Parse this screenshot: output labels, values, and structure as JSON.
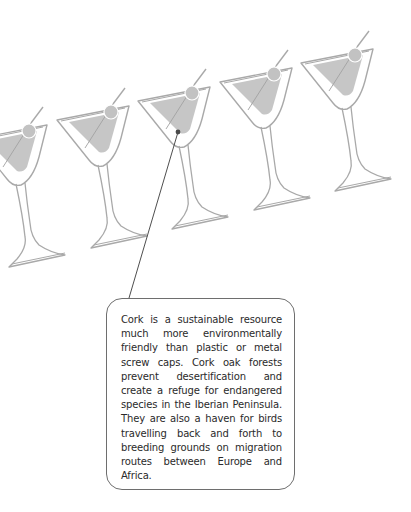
{
  "illustration": {
    "subject": "row of martini glasses",
    "glass_count": 5,
    "colors": {
      "outline": "#a9a9a9",
      "liquid": "#c6c6c6",
      "olive": "#c2c2c2",
      "pointer_line": "#3a3a3a",
      "pointer_dot": "#4a4a4a",
      "box_border": "#6e6e6e",
      "text": "#2a2a2a"
    }
  },
  "callout": {
    "text": "Cork is a sustainable resource much more environmentally friendly than plastic or metal screw caps. Cork oak forests prevent desertification and create a refuge for endangered species in the Iberian Peninsula. They are also a haven for birds travelling back and forth to breeding grounds on migration routes between Europe and Africa."
  }
}
